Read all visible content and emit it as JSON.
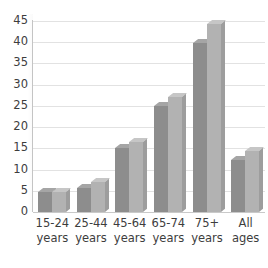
{
  "chart_data": {
    "type": "bar",
    "title": "",
    "title_cutoff_note": "",
    "xlabel": "",
    "ylabel": "",
    "ylim": [
      0,
      45
    ],
    "ytick_step": 5,
    "yticks": [
      "0",
      "5",
      "10",
      "15",
      "20",
      "25",
      "30",
      "35",
      "40",
      "45"
    ],
    "grid": true,
    "legend": "none",
    "style": "3d-clustered-bar-grayscale",
    "categories": [
      "15-24 years",
      "25-44 years",
      "45-64 years",
      "65-74 years",
      "75+ years",
      "All ages"
    ],
    "category_lines": [
      [
        "15-24",
        "years"
      ],
      [
        "25-44",
        "years"
      ],
      [
        "45-64",
        "years"
      ],
      [
        "65-74",
        "years"
      ],
      [
        "75+",
        "years"
      ],
      [
        "All",
        "ages"
      ]
    ],
    "series": [
      {
        "name": "Series 1",
        "color": "#8d8d8d",
        "values": [
          4.6,
          5.6,
          15.1,
          25.0,
          39.8,
          12.2
        ]
      },
      {
        "name": "Series 2",
        "color": "#b2b2b2",
        "values": [
          4.8,
          7.0,
          16.5,
          27.2,
          44.3,
          14.4
        ]
      }
    ]
  },
  "colors": {
    "series1": "#8d8d8d",
    "series2": "#b2b2b2",
    "gridline": "#e2e2e2",
    "axis": "#c4c4c4",
    "text": "#3d3d3d",
    "background": "#ffffff"
  }
}
